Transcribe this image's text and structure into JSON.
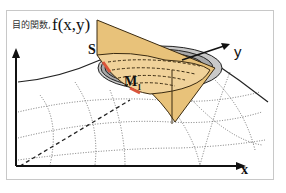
{
  "figure": {
    "title_japanese": "目的関数,",
    "title_function": "f(x,y)",
    "labels": {
      "S": "S",
      "y_axis": "y",
      "M": "M",
      "M_subscript": "1",
      "x_axis": "x"
    },
    "colors": {
      "plane_fill": "#e8c27a",
      "plane_edge": "#3a2a10",
      "contour_gray": "#9a9a9a",
      "contour_light": "#c9c9c9",
      "highlight_red": "#d9543a",
      "frame_border": "#c8c8c8",
      "axis": "#111111"
    }
  }
}
